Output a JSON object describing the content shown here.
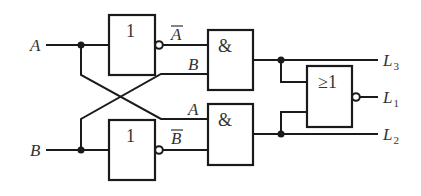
{
  "diagram": {
    "type": "logic-circuit",
    "inputs": [
      {
        "name": "A",
        "label": "A"
      },
      {
        "name": "B",
        "label": "B"
      }
    ],
    "gates": [
      {
        "id": "not_a",
        "type": "NOT",
        "symbol": "1",
        "input": "A",
        "output": "A_bar",
        "output_label": "A"
      },
      {
        "id": "not_b",
        "type": "NOT",
        "symbol": "1",
        "input": "B",
        "output": "B_bar",
        "output_label": "B"
      },
      {
        "id": "and_top",
        "type": "AND",
        "symbol": "&",
        "inputs": [
          "A_bar",
          "B"
        ],
        "input_labels": [
          "A",
          "B"
        ],
        "output": "L3"
      },
      {
        "id": "and_bottom",
        "type": "AND",
        "symbol": "&",
        "inputs": [
          "A",
          "B_bar"
        ],
        "input_labels": [
          "A",
          "B"
        ],
        "output": "L2"
      },
      {
        "id": "nor",
        "type": "NOR",
        "symbol": "≥1",
        "inputs": [
          "L3",
          "L2"
        ],
        "output": "L1"
      }
    ],
    "outputs": [
      {
        "name": "L3",
        "label": "L",
        "subscript": "3"
      },
      {
        "name": "L1",
        "label": "L",
        "subscript": "1"
      },
      {
        "name": "L2",
        "label": "L",
        "subscript": "2"
      }
    ],
    "wire_labels": {
      "a_bar": "A",
      "b_cross": "B",
      "a_cross": "A",
      "b_bar": "B"
    }
  }
}
